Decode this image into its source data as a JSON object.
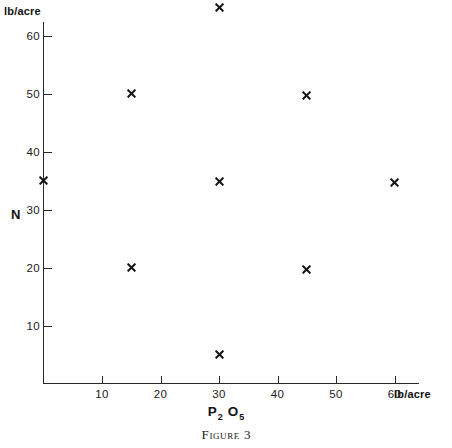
{
  "figure": {
    "caption_word": "Figure",
    "caption_number": "3"
  },
  "chart_data": {
    "type": "scatter",
    "title": "",
    "xlabel": "P2 O5",
    "xlabel_base": "P",
    "xlabel_sub1": "2",
    "xlabel_mid": "O",
    "xlabel_sub2": "5",
    "ylabel": "N",
    "x_unit": "lb/acre",
    "y_unit": "lb/acre",
    "xlim": [
      0,
      65
    ],
    "ylim": [
      0,
      67
    ],
    "grid": false,
    "legend": "none",
    "xticks": [
      10,
      20,
      30,
      40,
      50,
      60
    ],
    "xtick_labels": [
      "10",
      "20",
      "30",
      "40",
      "50",
      "60"
    ],
    "yticks": [
      10,
      20,
      30,
      40,
      50,
      60
    ],
    "ytick_labels": [
      "10",
      "20",
      "30",
      "40",
      "50",
      "60"
    ],
    "marker": "x",
    "marker_color": "#161616",
    "axis_color": "#2a2a2a",
    "points": [
      {
        "x": 30,
        "y": 64.8
      },
      {
        "x": 15,
        "y": 50.0
      },
      {
        "x": 45,
        "y": 49.6
      },
      {
        "x": 0,
        "y": 35.0
      },
      {
        "x": 30,
        "y": 34.8
      },
      {
        "x": 60,
        "y": 34.6
      },
      {
        "x": 15,
        "y": 20.0
      },
      {
        "x": 45,
        "y": 19.7
      },
      {
        "x": 30,
        "y": 5.0
      }
    ]
  }
}
